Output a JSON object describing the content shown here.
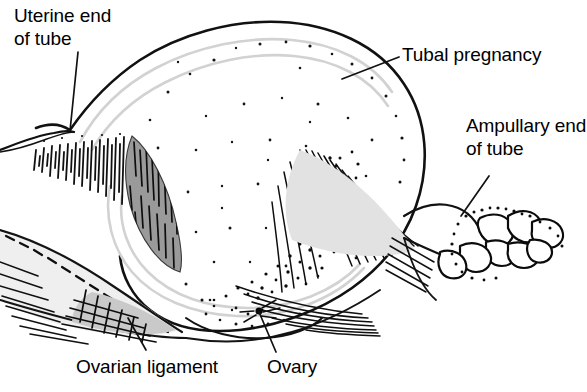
{
  "figure": {
    "kind": "medical-line-drawing",
    "background_color": "#ffffff",
    "ink_color": "#000000",
    "shade_gray": "#9a9a9a",
    "light_gray": "#d8d8d8"
  },
  "labels": {
    "uterine_end": {
      "line1": "Uterine end",
      "line2": "of tube",
      "text": "Uterine end of tube"
    },
    "tubal_pregnancy": {
      "line1": "Tubal pregnancy",
      "text": "Tubal pregnancy"
    },
    "ampullary_end": {
      "line1": "Ampullary end",
      "line2": "of tube",
      "text": "Ampullary end of tube"
    },
    "ovarian_ligament": {
      "line1": "Ovarian ligament",
      "text": "Ovarian ligament"
    },
    "ovary": {
      "line1": "Ovary",
      "text": "Ovary"
    }
  },
  "leader_lines": [
    {
      "name": "uterine-end-leader",
      "from": [
        78,
        52
      ],
      "to": [
        70,
        131
      ]
    },
    {
      "name": "tubal-pregnancy-leader",
      "from": [
        399,
        57
      ],
      "to": [
        342,
        79
      ]
    },
    {
      "name": "ampullary-end-leader",
      "from": [
        489,
        176
      ],
      "to": [
        461,
        216
      ]
    },
    {
      "name": "ovarian-ligament-leader",
      "from": [
        146,
        350
      ],
      "to": [
        128,
        318
      ]
    },
    {
      "name": "ovary-leader",
      "from": [
        276,
        352
      ],
      "to": [
        259,
        312
      ]
    }
  ]
}
